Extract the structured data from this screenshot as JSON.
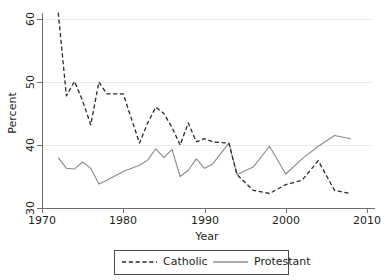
{
  "chart_data": {
    "type": "line",
    "title": "",
    "subtitle": "",
    "xlabel": "Year",
    "ylabel": "Percent",
    "xlim": [
      1970,
      2010
    ],
    "ylim": [
      30,
      60
    ],
    "xticks": [
      1970,
      1980,
      1990,
      2000,
      2010
    ],
    "xtick_labels": [
      "1970",
      "1980",
      "1990",
      "2000",
      "2010"
    ],
    "yticks": [
      30,
      40,
      50,
      60
    ],
    "ytick_labels": [
      "30",
      "40",
      "50",
      "60"
    ],
    "grid": "horizontal",
    "legend_position": "bottom-center",
    "series": [
      {
        "name": "Catholic",
        "style": "dashed",
        "color": "#2a2a2a",
        "x": [
          1972,
          1973,
          1974,
          1975,
          1976,
          1977,
          1978,
          1980,
          1982,
          1983,
          1984,
          1985,
          1986,
          1987,
          1988,
          1989,
          1990,
          1991,
          1993,
          1994,
          1996,
          1998,
          2000,
          2002,
          2004,
          2006,
          2008
        ],
        "values": [
          61.0,
          47.8,
          50.1,
          47.0,
          43.2,
          50.0,
          48.1,
          48.1,
          40.3,
          43.5,
          46.0,
          45.0,
          42.8,
          40.0,
          43.5,
          40.5,
          41.0,
          40.5,
          40.3,
          35.3,
          32.8,
          32.3,
          33.7,
          34.4,
          37.5,
          32.8,
          32.3
        ]
      },
      {
        "name": "Protestant",
        "style": "solid",
        "color": "#8a8a8a",
        "x": [
          1972,
          1973,
          1974,
          1975,
          1976,
          1977,
          1978,
          1980,
          1982,
          1983,
          1984,
          1985,
          1986,
          1987,
          1988,
          1989,
          1990,
          1991,
          1993,
          1994,
          1996,
          1998,
          2000,
          2002,
          2004,
          2006,
          2008
        ],
        "values": [
          38.0,
          36.3,
          36.2,
          37.3,
          36.3,
          33.8,
          34.4,
          35.8,
          36.8,
          37.6,
          39.4,
          38.0,
          39.3,
          35.0,
          36.0,
          37.8,
          36.3,
          37.0,
          40.3,
          35.3,
          36.5,
          39.8,
          35.4,
          37.8,
          39.8,
          41.5,
          41.0
        ]
      }
    ]
  },
  "legend": {
    "entries": [
      {
        "label": "Catholic",
        "style": "dashed"
      },
      {
        "label": "Protestant",
        "style": "solid"
      }
    ]
  }
}
